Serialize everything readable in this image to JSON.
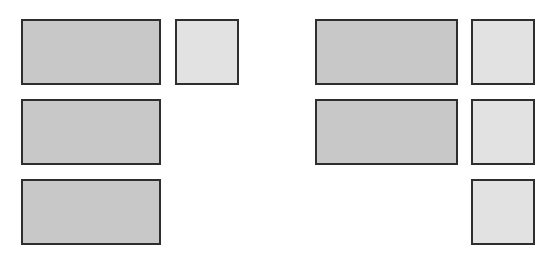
{
  "diagram": {
    "type": "base-ten-blocks-comparison",
    "colors": {
      "long_fill": "#c8c8c8",
      "unit_fill": "#e2e2e2",
      "border": "#2e2e2e",
      "background": "#ffffff"
    },
    "groups": [
      {
        "name": "left-group",
        "longs": 3,
        "units": 1,
        "blocks": [
          {
            "kind": "long",
            "x": 21,
            "y": 19,
            "w": 140,
            "h": 66
          },
          {
            "kind": "unit",
            "x": 175,
            "y": 19,
            "w": 64,
            "h": 66
          },
          {
            "kind": "long",
            "x": 21,
            "y": 99,
            "w": 140,
            "h": 66
          },
          {
            "kind": "long",
            "x": 21,
            "y": 179,
            "w": 140,
            "h": 66
          }
        ]
      },
      {
        "name": "right-group",
        "longs": 2,
        "units": 3,
        "blocks": [
          {
            "kind": "long",
            "x": 315,
            "y": 19,
            "w": 143,
            "h": 66
          },
          {
            "kind": "unit",
            "x": 471,
            "y": 19,
            "w": 64,
            "h": 66
          },
          {
            "kind": "long",
            "x": 315,
            "y": 99,
            "w": 143,
            "h": 66
          },
          {
            "kind": "unit",
            "x": 471,
            "y": 99,
            "w": 64,
            "h": 66
          },
          {
            "kind": "unit",
            "x": 471,
            "y": 179,
            "w": 64,
            "h": 66
          }
        ]
      }
    ]
  }
}
